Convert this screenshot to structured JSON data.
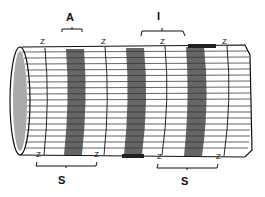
{
  "diagram": {
    "labels": {
      "a_band": "A",
      "i_band": "I",
      "z_top": [
        "Z",
        "Z",
        "Z",
        "Z"
      ],
      "z_bottom": [
        "Z",
        "Z",
        "Z",
        "Z"
      ],
      "sarcomere": [
        "S",
        "S"
      ]
    },
    "colors": {
      "ink": "#111111",
      "background": "#ffffff"
    }
  }
}
